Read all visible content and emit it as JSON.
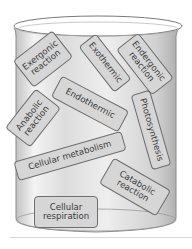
{
  "figure": {
    "type": "beaker-with-term-cards",
    "colors": {
      "card_fill": "#d6d6d6",
      "card_border": "#6e6e6e",
      "text": "#3a3a3a",
      "glass": "#c8c8c8"
    },
    "cards": [
      {
        "label": "Exergonic\nreaction",
        "x": 18,
        "y": 42,
        "w": 50,
        "h": 34,
        "rot": -38
      },
      {
        "label": "Exothermic",
        "x": 78,
        "y": 52,
        "w": 58,
        "h": 22,
        "rot": 52
      },
      {
        "label": "Endergonic\nreaction",
        "x": 118,
        "y": 50,
        "w": 58,
        "h": 28,
        "rot": 52
      },
      {
        "label": "Endothermic",
        "x": 52,
        "y": 92,
        "w": 76,
        "h": 24,
        "rot": 28
      },
      {
        "label": "Anabolic\nreaction",
        "x": 10,
        "y": 100,
        "w": 50,
        "h": 32,
        "rot": -52
      },
      {
        "label": "Photosynthesis",
        "x": 122,
        "y": 120,
        "w": 78,
        "h": 20,
        "rot": 74
      },
      {
        "label": "Cellular metabolism",
        "x": 12,
        "y": 146,
        "w": 112,
        "h": 20,
        "rot": -16
      },
      {
        "label": "Catabolic\nreaction",
        "x": 104,
        "y": 174,
        "w": 68,
        "h": 30,
        "rot": 30
      },
      {
        "label": "Cellular\nrespiration",
        "x": 34,
        "y": 196,
        "w": 64,
        "h": 32,
        "rot": 0
      }
    ]
  }
}
